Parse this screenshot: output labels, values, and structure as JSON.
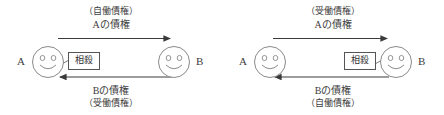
{
  "diagrams": [
    {
      "id": "left",
      "person_left": "A",
      "person_right": "B",
      "offset_label": "相殺",
      "offset_side": "left",
      "top_arrow": {
        "direction": "right",
        "line1": "（自働債権）",
        "line2": "Aの債権"
      },
      "bottom_arrow": {
        "direction": "left",
        "line1": "Bの債権",
        "line2": "（受働債権）"
      }
    },
    {
      "id": "right",
      "person_left": "A",
      "person_right": "B",
      "offset_label": "相殺",
      "offset_side": "right",
      "top_arrow": {
        "direction": "right",
        "line1": "（受働債権）",
        "line2": "Aの債権"
      },
      "bottom_arrow": {
        "direction": "left",
        "line1": "Bの債権",
        "line2": "（自働債権）"
      }
    }
  ],
  "colors": {
    "background": "#ffffff",
    "stroke": "#3a3a3a",
    "text": "#3d3d3d",
    "box_border": "#555555"
  }
}
